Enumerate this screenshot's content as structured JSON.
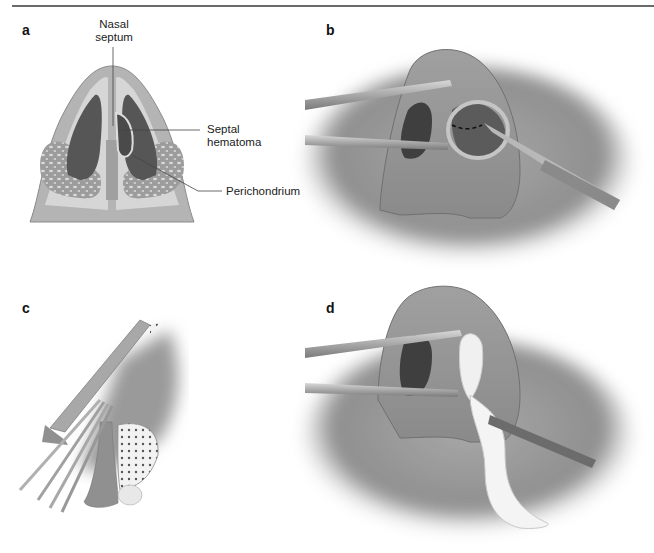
{
  "figure": {
    "panels": [
      {
        "letter": "a",
        "description": "Inferior view of nose showing septal hematoma"
      },
      {
        "letter": "b",
        "description": "Nasal speculum retracting nostril; scalpel incising hematoma along dashed line"
      },
      {
        "letter": "c",
        "description": "Sagittal view with instruments inserted into nasal cavity"
      },
      {
        "letter": "d",
        "description": "Nasal speculum with packing gauze inserted by forceps"
      }
    ],
    "labels": {
      "nasal_septum": "Nasal\nseptum",
      "nasal_septum_line1": "Nasal",
      "nasal_septum_line2": "septum",
      "septal_hematoma_line1": "Septal",
      "septal_hematoma_line2": "hematoma",
      "perichondrium": "Perichondrium"
    },
    "colors": {
      "skin": "#a9a9a9",
      "skin_light": "#c9c9c9",
      "cavity_dark": "#555555",
      "cartilage": "#b5b5b5",
      "gauze": "#f2f2f2",
      "line": "#6a6a6a"
    }
  }
}
